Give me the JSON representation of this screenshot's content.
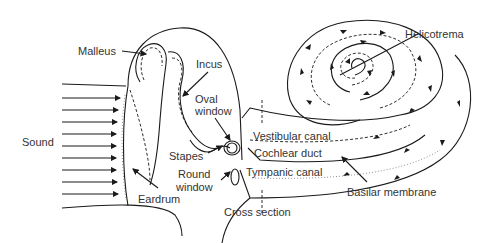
{
  "diagram": {
    "title": "",
    "labels": {
      "malleus": "Malleus",
      "incus": "Incus",
      "oval_window": [
        "Oval",
        "window"
      ],
      "sound": "Sound",
      "stapes": "Stapes",
      "round_window": [
        "Round",
        "window"
      ],
      "eardrum": "Eardrum",
      "cross_section": "Cross section",
      "vestibular_canal": "Vestibular canal",
      "cochlear_duct": "Cochlear duct",
      "tympanic_canal": "Tympanic canal",
      "basilar_membrane": "Basilar membrane",
      "helicotrema": "Helicotrema"
    },
    "sound_arrows": 9,
    "colors": {
      "ink": "#1a1a1a",
      "text": "#333333",
      "background": "#ffffff"
    }
  }
}
